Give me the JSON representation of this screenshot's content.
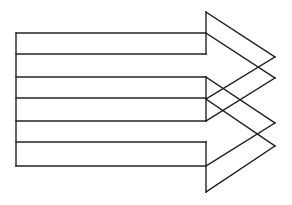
{
  "diagram": {
    "stroke_color": "#222222",
    "background": "#ffffff",
    "lines": [
      [
        16,
        33,
        16,
        166
      ],
      [
        16,
        33,
        206,
        33
      ],
      [
        16,
        54,
        206,
        54
      ],
      [
        16,
        77,
        206,
        77
      ],
      [
        16,
        98,
        206,
        98
      ],
      [
        16,
        121,
        206,
        121
      ],
      [
        16,
        142,
        206,
        142
      ],
      [
        16,
        166,
        206,
        166
      ],
      [
        206,
        12,
        206,
        54
      ],
      [
        206,
        77,
        206,
        121
      ],
      [
        206,
        142,
        206,
        192
      ],
      [
        206,
        12,
        275,
        57
      ],
      [
        206,
        33,
        275,
        78
      ],
      [
        275,
        57,
        206,
        99
      ],
      [
        275,
        78,
        206,
        121
      ],
      [
        206,
        77,
        275,
        123
      ],
      [
        206,
        99,
        275,
        146
      ],
      [
        275,
        123,
        206,
        166
      ],
      [
        275,
        146,
        206,
        192
      ]
    ]
  }
}
